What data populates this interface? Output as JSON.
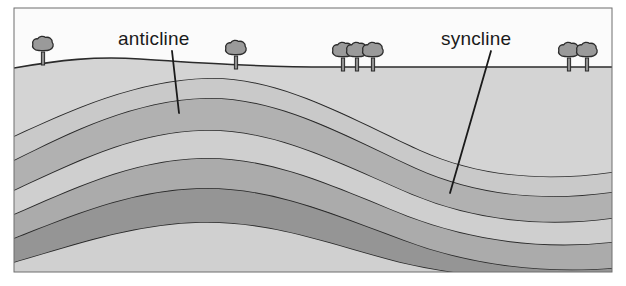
{
  "figure": {
    "kind": "geologic-cross-section",
    "title_visible": false,
    "background_color": "#ffffff",
    "frame": {
      "x": 14,
      "y": 8,
      "width": 598,
      "height": 264,
      "border_color": "#6f6f6f",
      "border_width": 1
    }
  },
  "labels": {
    "anticline": "anticline",
    "syncline": "syncline",
    "text_color": "#1a1a1a",
    "font_size_px": 19
  },
  "leader_lines": [
    {
      "name": "anticline-leader",
      "for": "anticline",
      "x1": 172,
      "y1": 51,
      "x2": 179,
      "y2": 113,
      "color": "#1a1a1a",
      "width": 1.8
    },
    {
      "name": "syncline-leader",
      "for": "syncline",
      "x1": 491,
      "y1": 51,
      "x2": 450,
      "y2": 193,
      "color": "#1a1a1a",
      "width": 1.8
    }
  ],
  "sky": {
    "color": "#fbfbfb",
    "description": "blank white sky above the ground surface"
  },
  "ground_surface": {
    "name": "ground-surface-line",
    "color": "#2b2b2b",
    "width": 1.6,
    "description": "gently undulating land surface, slight rise on the left",
    "path": "M14,68 C60,60 95,56 140,59 C200,63 260,67 330,67 C420,67 520,67 612,67"
  },
  "strata": [
    {
      "index": 0,
      "name": "stratum-surface-soil",
      "fill": "#d4d4d4",
      "description": "topmost light layer just beneath the ground surface"
    },
    {
      "index": 1,
      "name": "stratum-light-1",
      "fill": "#c9c9c9",
      "description": "light gray layer folded over the anticline crest"
    },
    {
      "index": 2,
      "name": "stratum-medium-1",
      "fill": "#b1b1b1",
      "description": "medium gray band arching over anticline, dipping into syncline"
    },
    {
      "index": 3,
      "name": "stratum-light-2",
      "fill": "#cfcfcf",
      "description": "light gray band between two medium bands"
    },
    {
      "index": 4,
      "name": "stratum-medium-2",
      "fill": "#ababab",
      "description": "medium gray band, strongly folded"
    },
    {
      "index": 5,
      "name": "stratum-dark-1",
      "fill": "#959595",
      "description": "darker gray band forming the anticline core"
    },
    {
      "index": 6,
      "name": "stratum-light-3",
      "fill": "#d0d0d0",
      "description": "light core layer at the bottom, cropping at base"
    },
    {
      "index": 7,
      "name": "stratum-base",
      "fill": "#a2a2a2",
      "description": "deepest visible layer at the bottom right"
    }
  ],
  "bed_boundary_color": "#2b2b2b",
  "bed_boundary_width": 1.6,
  "folds": [
    {
      "type": "anticline",
      "label": "anticline",
      "hinge_x": 185,
      "description": "arch-shaped upward fold, oldest rocks in the core"
    },
    {
      "type": "syncline",
      "label": "syncline",
      "hinge_x": 450,
      "description": "trough-shaped downward fold, youngest rocks in the core"
    }
  ],
  "trees": {
    "canopy_fill": "#9a9a9a",
    "canopy_stroke": "#2b2b2b",
    "trunk_fill": "#8f8f8f",
    "trunk_stroke": "#2b2b2b",
    "groups": [
      {
        "name": "tree-group-left",
        "count": 1,
        "x": 43,
        "ground_y": 61
      },
      {
        "name": "tree-group-left-center",
        "count": 1,
        "x": 236,
        "ground_y": 65
      },
      {
        "name": "tree-group-center",
        "count": 3,
        "x": 355,
        "ground_y": 67
      },
      {
        "name": "tree-group-right",
        "count": 2,
        "x": 578,
        "ground_y": 67
      }
    ]
  }
}
